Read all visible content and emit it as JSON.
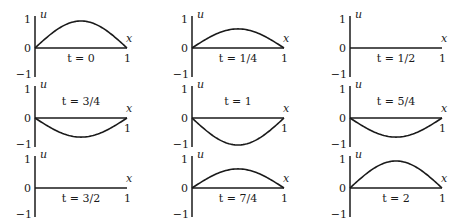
{
  "chart_data": {
    "type": "line",
    "title": "",
    "xlabel": "x",
    "ylabel": "u",
    "xlim": [
      0,
      1
    ],
    "ylim": [
      -1,
      1
    ],
    "grid": false,
    "legend": null,
    "y_ticks": [
      "1",
      "0",
      "−1"
    ],
    "x_ticks": [
      "1"
    ],
    "layout": {
      "rows": 3,
      "cols": 3
    },
    "panels": [
      {
        "t_label": "t = 0",
        "amplitude": 1.0,
        "label_pos": "below"
      },
      {
        "t_label": "t = 1/4",
        "amplitude": 0.707,
        "label_pos": "below"
      },
      {
        "t_label": "t = 1/2",
        "amplitude": 0.0,
        "label_pos": "below"
      },
      {
        "t_label": "t = 3/4",
        "amplitude": -0.707,
        "label_pos": "above"
      },
      {
        "t_label": "t = 1",
        "amplitude": -1.0,
        "label_pos": "above"
      },
      {
        "t_label": "t = 5/4",
        "amplitude": -0.707,
        "label_pos": "above"
      },
      {
        "t_label": "t = 3/2",
        "amplitude": 0.0,
        "label_pos": "below"
      },
      {
        "t_label": "t = 7/4",
        "amplitude": 0.707,
        "label_pos": "below"
      },
      {
        "t_label": "t = 2",
        "amplitude": 1.0,
        "label_pos": "below"
      }
    ],
    "series_note": "each panel plots u(x) = amplitude * sin(pi x) for x in [0,1]"
  },
  "labels": {
    "u": "u",
    "x": "x",
    "one": "1",
    "zero": "0",
    "minus_one": "−1"
  }
}
